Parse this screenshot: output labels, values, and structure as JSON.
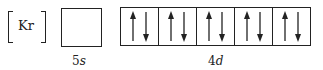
{
  "core": {
    "label": "Kr"
  },
  "subshells": [
    {
      "label": "5s",
      "orbitals": [
        {
          "up": false,
          "down": false
        }
      ]
    },
    {
      "label": "4d",
      "orbitals": [
        {
          "up": true,
          "down": true
        },
        {
          "up": true,
          "down": true
        },
        {
          "up": true,
          "down": true
        },
        {
          "up": true,
          "down": true
        },
        {
          "up": true,
          "down": true
        }
      ]
    }
  ]
}
